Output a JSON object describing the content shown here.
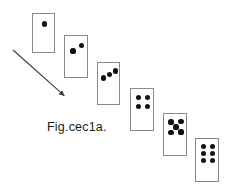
{
  "figure": {
    "caption": "Fig.cec1a.",
    "background_color": "#ffffff",
    "card_border_color": "#8a8a8a",
    "pip_color": "#111111",
    "arrow_color": "#3a3a3a",
    "width": 230,
    "height": 193
  },
  "arrow": {
    "name": "diagonal-arrow",
    "direction": "down-right",
    "start_x": 13,
    "start_y": 50,
    "end_x": 68,
    "end_y": 99,
    "stroke_width": 1.1
  },
  "cards": [
    {
      "index": 1,
      "pip_count": 1,
      "label": "card-1-pip",
      "x": 32,
      "y": 13,
      "width": 23,
      "height": 40,
      "pip_radius": 2.6,
      "pips": [
        {
          "x": 11.5,
          "y": 10.0
        }
      ]
    },
    {
      "index": 2,
      "pip_count": 2,
      "label": "card-2-pips",
      "x": 64,
      "y": 35,
      "width": 24,
      "height": 43,
      "pip_radius": 2.6,
      "pips": [
        {
          "x": 8.0,
          "y": 15.0
        },
        {
          "x": 16.5,
          "y": 9.5
        }
      ]
    },
    {
      "index": 3,
      "pip_count": 3,
      "label": "card-3-pips",
      "x": 97,
      "y": 62,
      "width": 23,
      "height": 43,
      "pip_radius": 2.6,
      "pips": [
        {
          "x": 5.5,
          "y": 15.0
        },
        {
          "x": 11.5,
          "y": 11.5
        },
        {
          "x": 17.5,
          "y": 8.0
        }
      ]
    },
    {
      "index": 4,
      "pip_count": 4,
      "label": "card-4-pips",
      "x": 130,
      "y": 88,
      "width": 24,
      "height": 43,
      "pip_radius": 2.6,
      "pips": [
        {
          "x": 7.5,
          "y": 8.5
        },
        {
          "x": 16.5,
          "y": 8.5
        },
        {
          "x": 7.5,
          "y": 17.5
        },
        {
          "x": 16.5,
          "y": 17.5
        }
      ]
    },
    {
      "index": 5,
      "pip_count": 5,
      "label": "card-5-pips",
      "x": 163,
      "y": 113,
      "width": 24,
      "height": 43,
      "pip_radius": 2.6,
      "pips": [
        {
          "x": 7.0,
          "y": 8.0
        },
        {
          "x": 17.0,
          "y": 7.5
        },
        {
          "x": 12.0,
          "y": 13.0
        },
        {
          "x": 7.0,
          "y": 18.5
        },
        {
          "x": 17.0,
          "y": 18.0
        }
      ]
    },
    {
      "index": 6,
      "pip_count": 6,
      "label": "card-6-pips",
      "x": 195,
      "y": 138,
      "width": 24,
      "height": 44,
      "pip_radius": 2.6,
      "pips": [
        {
          "x": 7.5,
          "y": 7.5
        },
        {
          "x": 16.5,
          "y": 7.5
        },
        {
          "x": 7.5,
          "y": 14.5
        },
        {
          "x": 16.5,
          "y": 14.5
        },
        {
          "x": 7.5,
          "y": 21.5
        },
        {
          "x": 16.5,
          "y": 21.5
        }
      ]
    }
  ]
}
